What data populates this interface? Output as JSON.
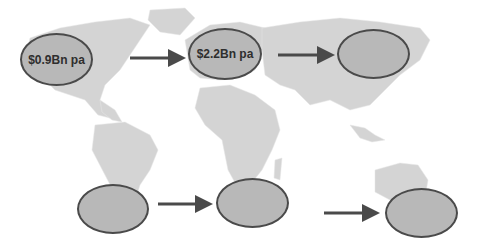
{
  "diagram": {
    "background": "world-map",
    "colors": {
      "land": "#d4d4d4",
      "ellipse_fill": "#b8b8b8",
      "ellipse_border": "#4a4a4a",
      "arrow": "#4a4a4a"
    },
    "nodes": [
      {
        "id": "north-america",
        "label": "$0.9Bn pa",
        "x": 20,
        "y": 33,
        "w": 73,
        "h": 53
      },
      {
        "id": "europe",
        "label": "$2.2Bn pa",
        "x": 188,
        "y": 28,
        "w": 74,
        "h": 52
      },
      {
        "id": "asia",
        "label": "",
        "x": 337,
        "y": 29,
        "w": 73,
        "h": 50
      },
      {
        "id": "south-america",
        "label": "",
        "x": 77,
        "y": 184,
        "w": 72,
        "h": 50
      },
      {
        "id": "africa",
        "label": "",
        "x": 216,
        "y": 178,
        "w": 73,
        "h": 50
      },
      {
        "id": "oceania",
        "label": "",
        "x": 385,
        "y": 188,
        "w": 73,
        "h": 50
      }
    ],
    "arrows": [
      {
        "from": "north-america",
        "to": "europe",
        "x1": 130,
        "y1": 58,
        "x2": 182,
        "y2": 58
      },
      {
        "from": "europe",
        "to": "asia",
        "x1": 278,
        "y1": 55,
        "x2": 331,
        "y2": 55
      },
      {
        "from": "south-america",
        "to": "africa",
        "x1": 158,
        "y1": 204,
        "x2": 209,
        "y2": 204
      },
      {
        "from": "africa",
        "to": "oceania",
        "x1": 324,
        "y1": 213,
        "x2": 376,
        "y2": 213
      }
    ]
  }
}
